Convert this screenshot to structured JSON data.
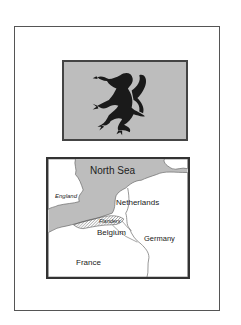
{
  "figure": {
    "flag": {
      "description": "Flag of Flanders - black rampant lion",
      "icon": "lion-rampant-icon",
      "background_color": "#bdbdbd",
      "emblem_color": "#1a1a1a"
    },
    "map": {
      "labels": {
        "north_sea": "North Sea",
        "england": "England",
        "netherlands": "Netherlands",
        "flanders": "Flanders",
        "belgium": "Belgium",
        "germany": "Germany",
        "france": "France"
      },
      "sea_color": "#bdbdbd",
      "land_color": "#ffffff"
    }
  }
}
